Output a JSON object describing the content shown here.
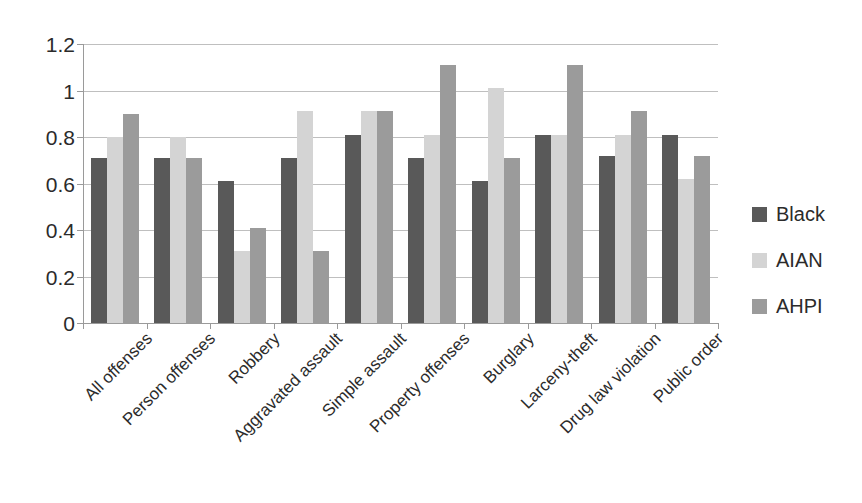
{
  "chart_data": {
    "type": "bar",
    "title": "",
    "subtitle": "",
    "xlabel": "",
    "ylabel": "",
    "ylim": [
      0,
      1.2
    ],
    "ytick_labels": [
      "1.2",
      "1",
      "0.8",
      "0.6",
      "0.4",
      "0.2",
      "0"
    ],
    "ytick_values": [
      1.2,
      1,
      0.8,
      0.6,
      0.4,
      0.2,
      0
    ],
    "grid": true,
    "legend_position": "right",
    "categories": [
      "All offenses",
      "Person offenses",
      "Robbery",
      "Aggravated assault",
      "Simple assault",
      "Property offenses",
      "Burglary",
      "Larceny-theft",
      "Drug law violation",
      "Public order"
    ],
    "series": [
      {
        "name": "Black",
        "color": "#595959",
        "values": [
          0.71,
          0.71,
          0.61,
          0.71,
          0.81,
          0.71,
          0.61,
          0.81,
          0.72,
          0.81
        ]
      },
      {
        "name": "AIAN",
        "color": "#d4d4d4",
        "values": [
          0.8,
          0.8,
          0.31,
          0.91,
          0.91,
          0.81,
          1.01,
          0.81,
          0.81,
          0.62
        ]
      },
      {
        "name": "AHPI",
        "color": "#9b9b9b",
        "values": [
          0.9,
          0.71,
          0.41,
          0.31,
          0.91,
          1.11,
          0.71,
          1.11,
          0.91,
          0.72
        ]
      }
    ]
  },
  "legend": {
    "entries": [
      "Black",
      "AIAN",
      "AHPI"
    ]
  },
  "colors": {
    "series_black": "#595959",
    "series_aian": "#d4d4d4",
    "series_ahpi": "#9b9b9b",
    "gridline": "#bfbfbf",
    "axis": "#9a9a9a",
    "text": "#2b2b2b",
    "background": "#ffffff"
  }
}
